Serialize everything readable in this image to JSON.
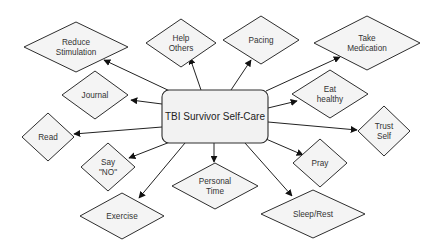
{
  "diagram": {
    "type": "mind-map",
    "center": {
      "label": "TBI Survivor Self-Care",
      "x": 162,
      "y": 90,
      "w": 106,
      "h": 53,
      "rx": 7
    },
    "colors": {
      "node_fill": "#f4f4f4",
      "center_fill": "#f2f2f2",
      "stroke": "#2e2e2e",
      "text": "#333333"
    },
    "nodes": [
      {
        "id": "reduce-stimulation",
        "lines": [
          "Reduce",
          "Stimulation"
        ],
        "cx": 76,
        "cy": 47,
        "w": 104,
        "h": 50,
        "from": [
          172,
          92
        ],
        "to": [
          104,
          60
        ]
      },
      {
        "id": "help-others",
        "lines": [
          "Help",
          "Others"
        ],
        "cx": 181,
        "cy": 43,
        "w": 70,
        "h": 48,
        "from": [
          201,
          90
        ],
        "to": [
          190,
          58
        ]
      },
      {
        "id": "pacing",
        "lines": [
          "Pacing"
        ],
        "cx": 261,
        "cy": 40,
        "w": 76,
        "h": 48,
        "from": [
          231,
          90
        ],
        "to": [
          251,
          60
        ]
      },
      {
        "id": "take-medication",
        "lines": [
          "Take",
          "Medication"
        ],
        "cx": 367,
        "cy": 43,
        "w": 106,
        "h": 54,
        "from": [
          266,
          91
        ],
        "to": [
          340,
          57
        ]
      },
      {
        "id": "journal",
        "lines": [
          "Journal"
        ],
        "cx": 95,
        "cy": 95,
        "w": 66,
        "h": 48,
        "from": [
          162,
          104
        ],
        "to": [
          131,
          100
        ]
      },
      {
        "id": "eat-healthy",
        "lines": [
          "Eat",
          "healthy"
        ],
        "cx": 330,
        "cy": 94,
        "w": 76,
        "h": 48,
        "from": [
          268,
          108
        ],
        "to": [
          297,
          101
        ]
      },
      {
        "id": "read",
        "lines": [
          "Read"
        ],
        "cx": 48,
        "cy": 137,
        "w": 52,
        "h": 48,
        "from": [
          162,
          127
        ],
        "to": [
          74,
          134
        ]
      },
      {
        "id": "trust-self",
        "lines": [
          "Trust",
          "Self"
        ],
        "cx": 384,
        "cy": 131,
        "w": 52,
        "h": 50,
        "from": [
          268,
          122
        ],
        "to": [
          357,
          130
        ]
      },
      {
        "id": "say-no",
        "lines": [
          "Say",
          "\"NO\""
        ],
        "cx": 108,
        "cy": 167,
        "w": 54,
        "h": 48,
        "from": [
          170,
          142
        ],
        "to": [
          129,
          158
        ]
      },
      {
        "id": "personal-time",
        "lines": [
          "Personal",
          "Time"
        ],
        "cx": 215,
        "cy": 186,
        "w": 86,
        "h": 46,
        "from": [
          214,
          143
        ],
        "to": [
          214,
          162
        ]
      },
      {
        "id": "pray",
        "lines": [
          "Pray"
        ],
        "cx": 320,
        "cy": 163,
        "w": 54,
        "h": 48,
        "from": [
          266,
          139
        ],
        "to": [
          303,
          155
        ]
      },
      {
        "id": "exercise",
        "lines": [
          "Exercise"
        ],
        "cx": 122,
        "cy": 216,
        "w": 84,
        "h": 46,
        "from": [
          185,
          143
        ],
        "to": [
          139,
          198
        ]
      },
      {
        "id": "sleep-rest",
        "lines": [
          "Sleep/Rest"
        ],
        "cx": 313,
        "cy": 214,
        "w": 104,
        "h": 48,
        "from": [
          245,
          143
        ],
        "to": [
          292,
          196
        ]
      }
    ]
  }
}
